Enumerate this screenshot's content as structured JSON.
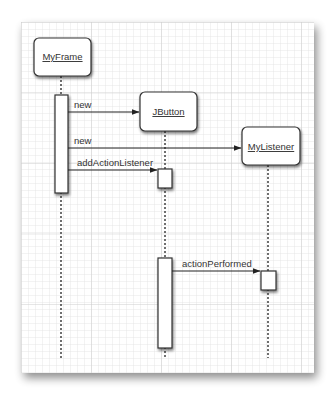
{
  "diagram": {
    "type": "sequence-diagram",
    "background": "#ffffff",
    "grid": {
      "minor_color": "#e4e4e4",
      "major_color": "#cfcfcf",
      "minor_step": 7,
      "major_step": 70
    },
    "objects": [
      {
        "id": "myframe",
        "label": "MyFrame",
        "x": 34,
        "y": 38,
        "w": 57,
        "h": 38,
        "lifeline_x": 61
      },
      {
        "id": "jbutton",
        "label": "JButton",
        "x": 140,
        "y": 92,
        "w": 57,
        "h": 39,
        "lifeline_x": 165
      },
      {
        "id": "mylistener",
        "label": "MyListener",
        "x": 242,
        "y": 127,
        "w": 58,
        "h": 38,
        "lifeline_x": 268
      }
    ],
    "messages": [
      {
        "label": "new",
        "from": "myframe",
        "to": "jbutton",
        "y": 112
      },
      {
        "label": "new",
        "from": "myframe",
        "to": "mylistener",
        "y": 148
      },
      {
        "label": "addActionListener",
        "from": "myframe",
        "to": "jbutton",
        "y": 170
      },
      {
        "label": "actionPerformed",
        "from": "jbutton",
        "to": "mylistener",
        "y": 271
      }
    ],
    "labels": {
      "obj1": "MyFrame",
      "obj2": "JButton",
      "obj3": "MyListener",
      "msg1": "new",
      "msg2": "new",
      "msg3": "addActionListener",
      "msg4": "actionPerformed"
    }
  }
}
